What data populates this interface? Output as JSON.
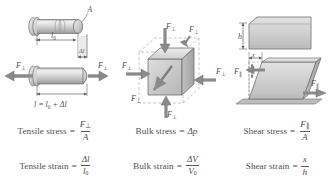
{
  "figure": {
    "type": "physics-diagram",
    "background": "#ffffff",
    "columns": [
      {
        "id": "tensile",
        "title": "Tensile stress and strain",
        "labels": {
          "area": "A",
          "original_length": "l0",
          "delta_length": "Δl",
          "force": "F⊥",
          "total_length_eq": "l = l0 + Δl"
        },
        "stress_formula": {
          "name": "Tensile stress",
          "numerator": "F⊥",
          "denominator": "A"
        },
        "strain_formula": {
          "name": "Tensile strain",
          "numerator": "Δl",
          "denominator": "l0"
        }
      },
      {
        "id": "bulk",
        "title": "Bulk stress and strain",
        "labels": {
          "force": "F⊥",
          "force_count": 6
        },
        "stress_formula": {
          "name": "Bulk stress",
          "value": "Δp"
        },
        "strain_formula": {
          "name": "Bulk strain",
          "numerator": "ΔV",
          "denominator": "V0"
        }
      },
      {
        "id": "shear",
        "title": "Shear stress and strain",
        "labels": {
          "height": "h",
          "displacement": "x",
          "force": "F∥"
        },
        "stress_formula": {
          "name": "Shear stress",
          "numerator": "F∥",
          "denominator": "A"
        },
        "strain_formula": {
          "name": "Shear strain",
          "numerator": "x",
          "denominator": "h"
        }
      }
    ],
    "colors": {
      "body_light": "#e6e6e6",
      "body_mid": "#c9c9c9",
      "body_dark": "#a8a8a8",
      "outline": "#6e6e6e",
      "arrow": "#8c8c8c",
      "dashed": "#b0b0b0",
      "text": "#4f4f4f"
    }
  }
}
